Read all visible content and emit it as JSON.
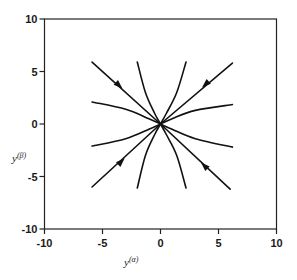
{
  "chart_data": {
    "type": "line",
    "subtype": "phase-portrait",
    "title": "",
    "xlabel": "y(α)",
    "ylabel": "y(β)",
    "xlim": [
      -10,
      10
    ],
    "ylim": [
      -10,
      10
    ],
    "xticks": [
      -10,
      -5,
      0,
      5,
      10
    ],
    "yticks": [
      -10,
      -5,
      0,
      5,
      10
    ],
    "xtick_labels": [
      "-10",
      "-5",
      "0",
      "5",
      "10"
    ],
    "ytick_labels": [
      "-10",
      "-5",
      "0",
      "5",
      "10"
    ],
    "grid": false,
    "legend": null,
    "fixed_point": {
      "x": 0,
      "y": 0,
      "kind": "stable node"
    },
    "series": [
      {
        "name": "diag-upper-left",
        "points": [
          [
            -5.9,
            5.9
          ],
          [
            0,
            0
          ]
        ],
        "arrow_at": [
          -3.6,
          3.7
        ],
        "direction": "toward origin"
      },
      {
        "name": "diag-upper-right",
        "points": [
          [
            6.2,
            5.8
          ],
          [
            0,
            0
          ]
        ],
        "arrow_at": [
          3.9,
          3.8
        ],
        "direction": "toward origin"
      },
      {
        "name": "diag-lower-left",
        "points": [
          [
            -5.9,
            -6.0
          ],
          [
            0,
            0
          ]
        ],
        "arrow_at": [
          -3.4,
          -3.6
        ],
        "direction": "toward origin"
      },
      {
        "name": "diag-lower-right",
        "points": [
          [
            6.0,
            -6.2
          ],
          [
            0,
            0
          ]
        ],
        "arrow_at": [
          3.8,
          -4.0
        ],
        "direction": "toward origin"
      },
      {
        "name": "flat-upper-left",
        "points": [
          [
            -5.9,
            2.1
          ],
          [
            -3,
            1.4
          ],
          [
            -1,
            0.5
          ],
          [
            0,
            0
          ]
        ]
      },
      {
        "name": "flat-upper-right",
        "points": [
          [
            6.2,
            1.85
          ],
          [
            3,
            1.3
          ],
          [
            1,
            0.5
          ],
          [
            0,
            0
          ]
        ]
      },
      {
        "name": "flat-lower-left",
        "points": [
          [
            -5.9,
            -2.1
          ],
          [
            -3,
            -1.4
          ],
          [
            -1,
            -0.5
          ],
          [
            0,
            0
          ]
        ]
      },
      {
        "name": "flat-lower-right",
        "points": [
          [
            6.2,
            -2.2
          ],
          [
            3,
            -1.4
          ],
          [
            1,
            -0.5
          ],
          [
            0,
            0
          ]
        ]
      },
      {
        "name": "steep-upper-left",
        "points": [
          [
            -2.0,
            5.9
          ],
          [
            -1.3,
            3
          ],
          [
            -0.5,
            1
          ],
          [
            0,
            0
          ]
        ]
      },
      {
        "name": "steep-upper-right",
        "points": [
          [
            2.2,
            5.9
          ],
          [
            1.4,
            3
          ],
          [
            0.5,
            1
          ],
          [
            0,
            0
          ]
        ]
      },
      {
        "name": "steep-lower-left",
        "points": [
          [
            -2.0,
            -6.1
          ],
          [
            -1.3,
            -3
          ],
          [
            -0.5,
            -1
          ],
          [
            0,
            0
          ]
        ]
      },
      {
        "name": "steep-lower-right",
        "points": [
          [
            2.2,
            -6.1
          ],
          [
            1.4,
            -3
          ],
          [
            0.5,
            -1
          ],
          [
            0,
            0
          ]
        ]
      }
    ]
  },
  "labels": {
    "x_axis_main": "y",
    "x_axis_sup": "(α)",
    "y_axis_main": "y",
    "y_axis_sup": "(β)"
  }
}
